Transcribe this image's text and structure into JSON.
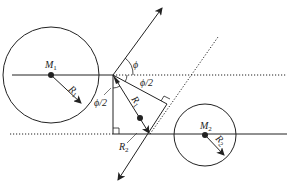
{
  "diagram": {
    "type": "geometry-diagram",
    "labels": {
      "m1": "M",
      "m1_sub": "1",
      "m2": "M",
      "m2_sub": "2",
      "r1_circle": "R",
      "r1_circle_sub": "1",
      "r1_vector": "R",
      "r1_vector_sub": "1",
      "r2_circle": "R",
      "r2_circle_sub": "2",
      "r2_segment": "R",
      "r2_segment_sub": "2",
      "phi": "ϕ",
      "phi_half_right": "ϕ/2",
      "phi_half_left": "ϕ/2"
    },
    "colors": {
      "stroke": "#222222",
      "background": "#ffffff"
    }
  }
}
